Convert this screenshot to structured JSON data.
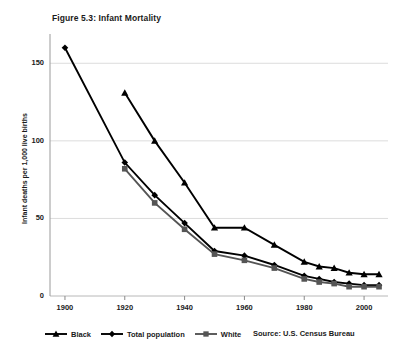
{
  "figure": {
    "title": "Figure 5.3: Infant Mortality",
    "source": "Source: U.S. Census Bureau"
  },
  "chart_data": {
    "type": "line",
    "title": "Figure 5.3: Infant Mortality",
    "xlabel": "",
    "ylabel": "Infant deaths per 1,000 live births",
    "xlim": [
      1895,
      2008
    ],
    "ylim": [
      0,
      165
    ],
    "yticks": [
      0,
      50,
      100,
      150
    ],
    "ytick_labels": [
      "0",
      "50",
      "100",
      "150"
    ],
    "xticks": [
      1900,
      1920,
      1940,
      1960,
      1980,
      2000
    ],
    "xtick_labels": [
      "1900",
      "1920",
      "1940",
      "1960",
      "1980",
      "2000"
    ],
    "grid": "horizontal",
    "legend_position": "below-left",
    "series": [
      {
        "name": "Black",
        "marker": "triangle",
        "color": "#000000",
        "x": [
          1920,
          1930,
          1940,
          1950,
          1960,
          1970,
          1980,
          1985,
          1990,
          1995,
          2000,
          2005
        ],
        "values": [
          131,
          100,
          73,
          44,
          44,
          33,
          22,
          19,
          18,
          15,
          14,
          14
        ]
      },
      {
        "name": "Total population",
        "marker": "diamond",
        "color": "#000000",
        "x": [
          1900,
          1920,
          1930,
          1940,
          1950,
          1960,
          1970,
          1980,
          1985,
          1990,
          1995,
          2000,
          2005
        ],
        "values": [
          160,
          86,
          65,
          47,
          29,
          26,
          20,
          13,
          11,
          9,
          8,
          7,
          7
        ]
      },
      {
        "name": "White",
        "marker": "square",
        "color": "#555555",
        "x": [
          1920,
          1930,
          1940,
          1950,
          1960,
          1970,
          1980,
          1985,
          1990,
          1995,
          2000,
          2005
        ],
        "values": [
          82,
          60,
          43,
          27,
          23,
          18,
          11,
          9,
          8,
          6,
          6,
          6
        ]
      }
    ]
  },
  "legend": {
    "items": [
      {
        "label": "Black",
        "marker": "triangle"
      },
      {
        "label": "Total population",
        "marker": "diamond"
      },
      {
        "label": "White",
        "marker": "square"
      }
    ]
  },
  "axes": {
    "y_title": "Infant deaths per 1,000 live births"
  }
}
